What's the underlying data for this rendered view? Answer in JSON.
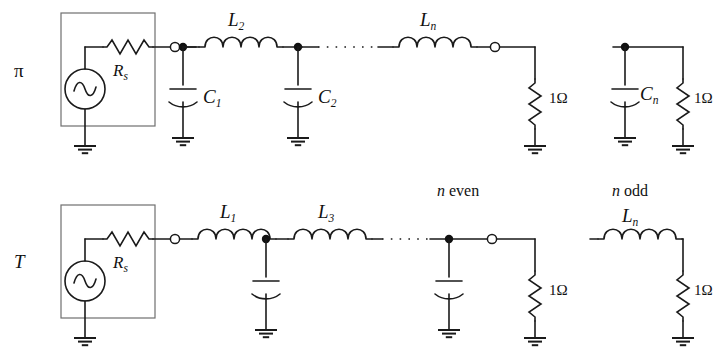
{
  "figure": {
    "type": "circuit-schematic",
    "title": "",
    "background_color": "#ffffff",
    "line_color": "#1a1a1a",
    "source_box_color": "#6f6f6f",
    "width": 715,
    "height": 357
  },
  "rows": [
    {
      "id": "pi-row",
      "name_label": "π",
      "topology": "pi-ladder-lowpass",
      "source": {
        "symbol": "ac-source",
        "resistor_label": "R",
        "resistor_subscript": "s",
        "grounded": true,
        "boxed": true
      },
      "series_elements": [
        {
          "kind": "inductor",
          "label": "L",
          "subscript": "2"
        },
        {
          "kind": "inductor",
          "label": "L",
          "subscript": "n"
        }
      ],
      "shunt_elements": [
        {
          "kind": "capacitor",
          "label": "C",
          "subscript": "1"
        },
        {
          "kind": "capacitor",
          "label": "C",
          "subscript": "2"
        }
      ],
      "load": {
        "kind": "resistor",
        "label": "1Ω"
      },
      "ellipsis": true,
      "variant": {
        "label": "",
        "shunt": {
          "kind": "capacitor",
          "label": "C",
          "subscript": "n"
        },
        "load": {
          "kind": "resistor",
          "label": "1Ω"
        }
      }
    },
    {
      "id": "t-row",
      "name_label": "T",
      "topology": "t-ladder-lowpass",
      "source": {
        "symbol": "ac-source",
        "resistor_label": "R",
        "resistor_subscript": "s",
        "grounded": true,
        "boxed": true
      },
      "series_elements": [
        {
          "kind": "inductor",
          "label": "L",
          "subscript": "1"
        },
        {
          "kind": "inductor",
          "label": "L",
          "subscript": "3"
        }
      ],
      "shunt_elements": [
        {
          "kind": "capacitor",
          "label": "",
          "subscript": ""
        },
        {
          "kind": "capacitor",
          "label": "",
          "subscript": ""
        }
      ],
      "load": {
        "kind": "resistor",
        "label": "1Ω"
      },
      "ellipsis": true,
      "variant": {
        "label": "",
        "series": {
          "kind": "inductor",
          "label": "L",
          "subscript": "n"
        },
        "load": {
          "kind": "resistor",
          "label": "1Ω"
        }
      }
    }
  ],
  "annotations": {
    "n_even": {
      "italic": "n",
      "roman": "even"
    },
    "n_odd": {
      "italic": "n",
      "roman": "odd"
    }
  },
  "icons": {
    "ac_source": "sine-wave-source-icon",
    "ground": "ground-icon",
    "node": "junction-dot-icon",
    "terminal": "open-terminal-icon",
    "inductor": "inductor-coil-icon",
    "capacitor": "capacitor-icon",
    "resistor": "resistor-zigzag-icon"
  }
}
